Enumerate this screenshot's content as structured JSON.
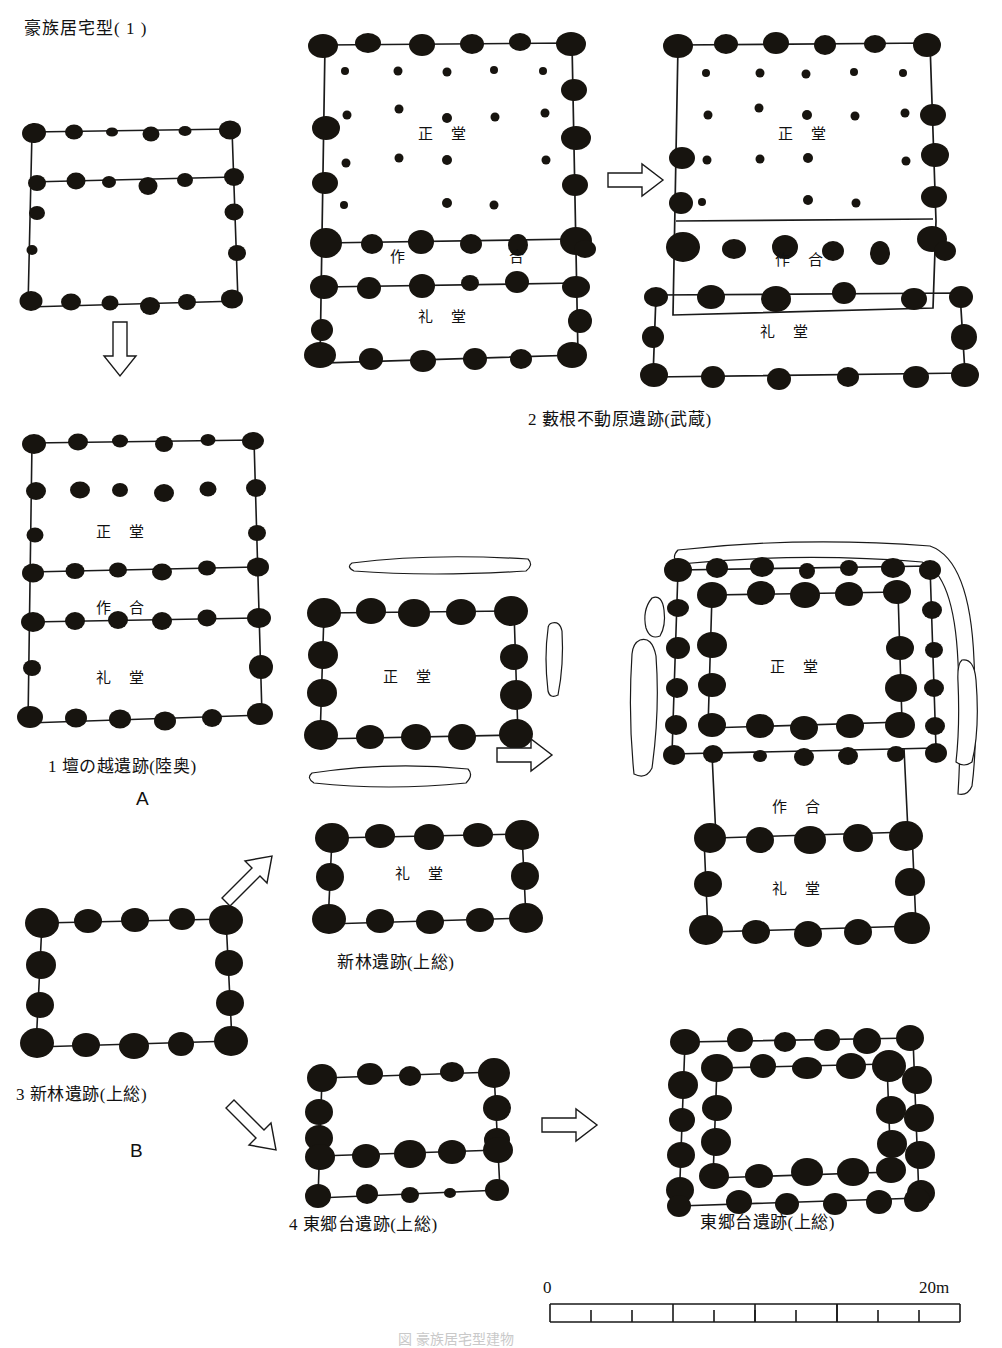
{
  "figure": {
    "title": "豪族居宅型( 1 )",
    "bottom_caption": "図  豪族居宅型建物"
  },
  "rooms": {
    "main_hall": "正 堂",
    "connector": "作 合",
    "worship_hall": "礼 堂"
  },
  "group_labels": {
    "a": "A",
    "b": "B"
  },
  "captions": {
    "site1": "1 壇の越遺跡(陸奥)",
    "site2": "2 藪根不動原遺跡(武蔵)",
    "site3": "3 新林遺跡(上総)",
    "site4": "4 東郷台遺跡(上総)",
    "site3_result": "新林遺跡(上総)",
    "site4_result": "東郷台遺跡(上総)"
  },
  "scale": {
    "start": "0",
    "end": "20m",
    "minor_ticks": 10,
    "minor_span_m": 10,
    "major_ticks_m": [
      10,
      15,
      20
    ]
  },
  "arrows": {
    "down": "down-arrow",
    "right": "right-arrow",
    "up_right": "up-right-arrow",
    "down_right": "down-right-arrow"
  },
  "colors": {
    "ink": "#111111",
    "posthole": "#17140f",
    "line": "#1a1a1a",
    "paper": "#ffffff"
  }
}
